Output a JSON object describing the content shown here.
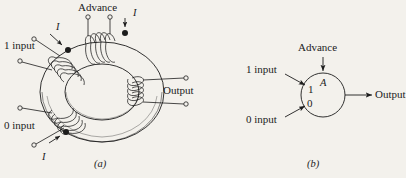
{
  "figure": {
    "type": "magnetic-core-memory-diagram",
    "background_color": "#f3f1ec",
    "ink_color": "#1c1c1c",
    "panels": [
      {
        "id": "a",
        "caption": "(a)",
        "description": "Toroidal ferrite core with four wire windings",
        "labels": {
          "advance": "Advance",
          "one_input": "1 input",
          "zero_input": "0 input",
          "output": "Output",
          "current_advance": "I",
          "current_one": "I",
          "current_zero": "I"
        }
      },
      {
        "id": "b",
        "caption": "(b)",
        "description": "Equivalent logic symbol: circle labelled A",
        "labels": {
          "advance": "Advance",
          "one_input": "1 input",
          "zero_input": "0 input",
          "output": "Output",
          "core_name": "A",
          "state_one": "1",
          "state_zero": "0"
        }
      }
    ]
  }
}
